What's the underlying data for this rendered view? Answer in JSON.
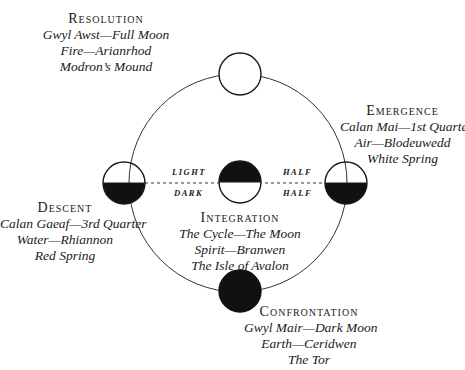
{
  "diagram": {
    "nodes": [
      {
        "id": "resolution",
        "title": "Resolution",
        "lines": [
          "Gwyl Awst—Full Moon",
          "Fire—Arianrhod",
          "Modron’s Mound"
        ],
        "moon": "full"
      },
      {
        "id": "emergence",
        "title": "Emergence",
        "lines": [
          "Calan Mai—1st Quarter",
          "Air—Blodeuwedd",
          "White Spring"
        ],
        "moon": "half-light-top"
      },
      {
        "id": "descent",
        "title": "Descent",
        "lines": [
          "Calan Gaeaf—3rd Quarter",
          "Water—Rhiannon",
          "Red Spring"
        ],
        "moon": "half-light-top"
      },
      {
        "id": "integration",
        "title": "Integration",
        "lines": [
          "The Cycle—The Moon",
          "Spirit—Branwen",
          "The Isle of Avalon"
        ],
        "moon": "half-dark-top"
      },
      {
        "id": "confrontation",
        "title": "Confrontation",
        "lines": [
          "Gwyl Mair—Dark Moon",
          "Earth—Ceridwen",
          "The Tor"
        ],
        "moon": "dark"
      }
    ],
    "phase_labels": {
      "left_top": "Light",
      "left_bottom": "Dark",
      "right_top": "Half",
      "right_bottom": "Half"
    },
    "colors": {
      "stroke": "#1a1a1a",
      "fill_dark": "#111111",
      "fill_light": "#ffffff"
    }
  }
}
